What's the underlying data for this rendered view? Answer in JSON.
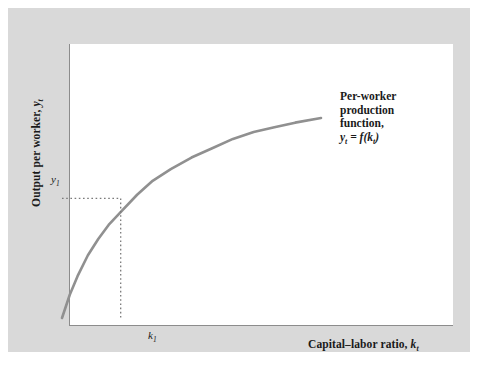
{
  "figure": {
    "background_color": "#d9d9d9",
    "plot_background_color": "#ffffff",
    "axis_color": "#8c8c8c",
    "curve_color": "#909090",
    "guide_color": "#8c8c8c",
    "text_color": "#1a1a1a"
  },
  "axes": {
    "y_title_prefix": "Output per worker, ",
    "y_title_var": "y",
    "y_title_sub": "t",
    "x_title_prefix": "Capital–labor ratio, ",
    "x_title_var": "k",
    "x_title_sub": "t",
    "y_tick_var": "y",
    "y_tick_sub": "1",
    "x_tick_var": "k",
    "x_tick_sub": "1"
  },
  "annotation": {
    "line1": "Per-worker",
    "line2": "production",
    "line3": "function,",
    "formula_lhs_var": "y",
    "formula_lhs_sub": "t",
    "formula_eq": " = ",
    "formula_f": "f",
    "formula_open": "(",
    "formula_arg_var": "k",
    "formula_arg_sub": "t",
    "formula_close": ")"
  },
  "chart_data": {
    "type": "line",
    "title": "Per-worker production function",
    "xlabel": "Capital–labor ratio, k_t",
    "ylabel": "Output per worker, y_t",
    "grid": false,
    "legend": "none",
    "annotations": [
      {
        "text": "Per-worker production function, y_t = f(k_t)",
        "x_px": 332,
        "y_px": 82
      }
    ],
    "axis_ticks": {
      "x": [
        "k_1"
      ],
      "y": [
        "y_1"
      ]
    },
    "xlim": [
      0,
      1
    ],
    "ylim": [
      0,
      1
    ],
    "series": [
      {
        "name": "y_t = f(k_t)",
        "description": "Concave increasing per-worker production function starting at origin with diminishing marginal returns",
        "color": "#909090",
        "x": [
          0.0,
          0.03,
          0.06,
          0.1,
          0.14,
          0.18,
          0.23,
          0.29,
          0.35,
          0.42,
          0.5,
          0.58,
          0.66,
          0.74,
          0.82,
          0.9,
          1.0
        ],
        "y": [
          0.0,
          0.1,
          0.18,
          0.27,
          0.34,
          0.4,
          0.46,
          0.53,
          0.59,
          0.64,
          0.69,
          0.73,
          0.77,
          0.8,
          0.82,
          0.84,
          0.86
        ]
      }
    ],
    "markers": [
      {
        "name": "k1-y1-point",
        "x": 0.2266,
        "y": 0.5142,
        "x_label": "k_1",
        "y_label": "y_1",
        "guides": "dotted"
      }
    ]
  }
}
